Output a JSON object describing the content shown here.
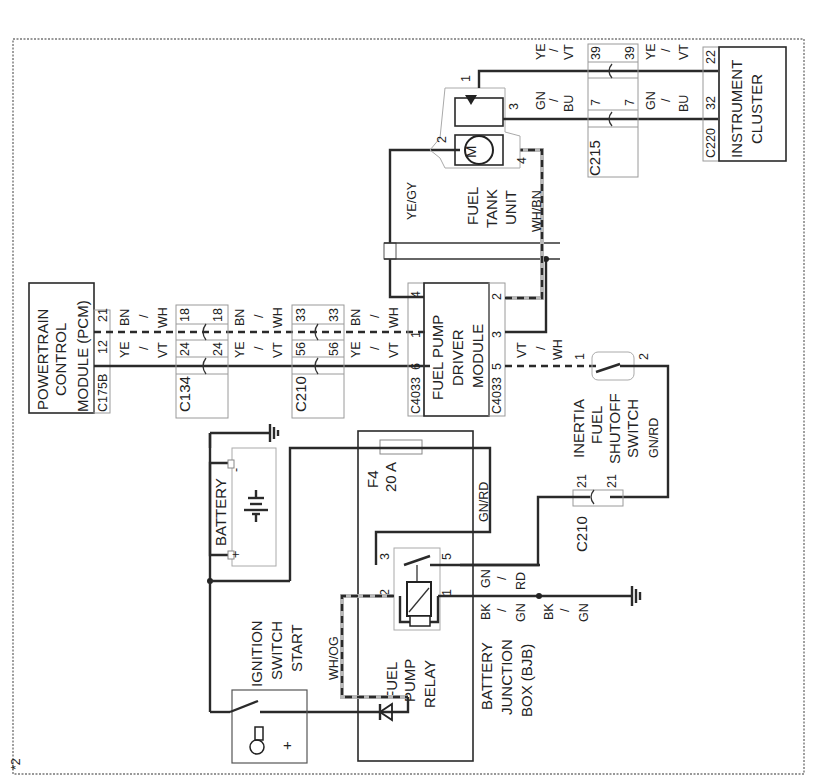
{
  "diagram": {
    "orientation": "rotated 90° counter-clockwise",
    "page_marker": "*2",
    "components": {
      "pcm": {
        "lines": [
          "POWERTRAIN",
          "CONTROL",
          "MODULE (PCM)"
        ],
        "connector": "C175B",
        "pins": [
          "12",
          "21"
        ]
      },
      "c134": {
        "label": "C134",
        "pins": [
          "24",
          "18"
        ]
      },
      "c210_top": {
        "label": "C210",
        "pins": [
          "56",
          "33"
        ]
      },
      "fpdm": {
        "lines": [
          "FUEL PUMP",
          "DRIVER",
          "MODULE"
        ],
        "connector_left": "C4033",
        "connector_right": "C4033",
        "pins_left": [
          "6",
          "1",
          "4"
        ],
        "pins_right": [
          "5",
          "3",
          "2"
        ]
      },
      "fuel_tank": {
        "lines": [
          "FUEL",
          "TANK",
          "UNIT"
        ],
        "pins": [
          "1",
          "2",
          "3",
          "4"
        ],
        "motor_symbol": "M"
      },
      "c215": {
        "label": "C215",
        "pins": [
          "39",
          "7"
        ]
      },
      "cluster": {
        "lines": [
          "INSTRUMENT",
          "CLUSTER"
        ],
        "connector": "C220",
        "pins": [
          "22",
          "32"
        ]
      },
      "battery": {
        "label": "BATTERY",
        "neg": "-",
        "pos": "+"
      },
      "bjb": {
        "lines": [
          "BATTERY",
          "JUNCTION",
          "BOX (BJB)"
        ]
      },
      "fuse": {
        "id": "F4",
        "rating": "20 A"
      },
      "relay": {
        "lines": [
          "FUEL",
          "PUMP",
          "RELAY"
        ],
        "pins": [
          "3",
          "5",
          "2",
          "1"
        ]
      },
      "ignition": {
        "lines": [
          "IGNITION",
          "SWITCH",
          "START"
        ],
        "plus": "+"
      },
      "inertia": {
        "lines": [
          "INERTIA",
          "FUEL",
          "SHUTOFF",
          "SWITCH"
        ],
        "pins": [
          "1",
          "2"
        ]
      },
      "c210_bottom": {
        "label": "C210",
        "pins": [
          "21",
          "21"
        ]
      }
    },
    "wire_colors": {
      "ye_vt": [
        "YE",
        "/",
        "VT"
      ],
      "bn_wh": [
        "BN",
        "/",
        "WH"
      ],
      "vt_wh": [
        "VT",
        "/",
        "WH"
      ],
      "gn_bu": [
        "GN",
        "/",
        "BU"
      ],
      "gn_rd": [
        "GN",
        "/",
        "RD"
      ],
      "bk_gn": [
        "BK",
        "/",
        "GN"
      ],
      "ye_gy": "YE/GY",
      "wh_bn": "WH/BN",
      "wh_og": "WH/OG",
      "gn_rd_single": "GN/RD"
    }
  }
}
